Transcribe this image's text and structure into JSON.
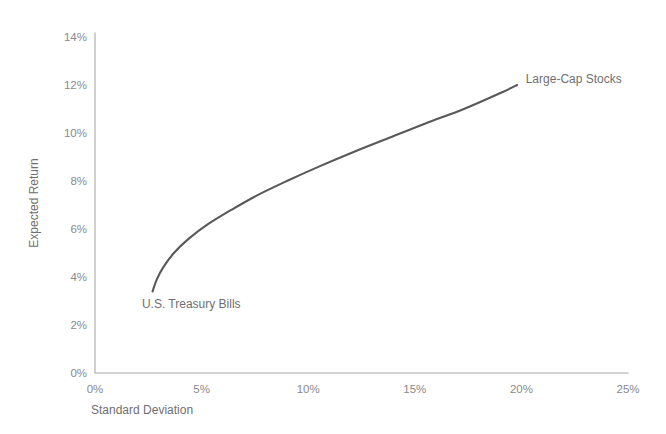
{
  "chart_data": {
    "type": "line",
    "title": "",
    "subtitle": "",
    "xlabel": "Standard Deviation",
    "ylabel": "Expected Return",
    "xlim": [
      0,
      25
    ],
    "ylim": [
      0,
      14
    ],
    "grid": false,
    "legend": "none",
    "x_ticks": [
      "0%",
      "5%",
      "10%",
      "15%",
      "20%",
      "25%"
    ],
    "x_tick_values": [
      0,
      5,
      10,
      15,
      20,
      25
    ],
    "y_ticks": [
      "0%",
      "2%",
      "4%",
      "6%",
      "8%",
      "10%",
      "12%",
      "14%"
    ],
    "y_tick_values": [
      0,
      2,
      4,
      6,
      8,
      10,
      12,
      14
    ],
    "series": [
      {
        "name": "Efficient Frontier",
        "color": "#59595b",
        "x": [
          2.7,
          2.9,
          3.2,
          3.7,
          4.4,
          5.3,
          6.4,
          7.6,
          9.0,
          10.5,
          12.1,
          13.8,
          15.5,
          17.3,
          19.1,
          19.8
        ],
        "y": [
          3.4,
          3.9,
          4.4,
          5.0,
          5.6,
          6.2,
          6.8,
          7.4,
          8.0,
          8.6,
          9.2,
          9.8,
          10.4,
          11.0,
          11.7,
          12.0
        ]
      }
    ],
    "annotations": [
      {
        "label": "Large-Cap Stocks",
        "x": 20.2,
        "y": 12.1,
        "anchor": "start"
      },
      {
        "label": "U.S. Treasury Bills",
        "x": 2.2,
        "y": 2.7,
        "anchor": "start"
      }
    ]
  },
  "axes": {
    "x_title": "Standard Deviation",
    "y_title": "Expected Return"
  }
}
